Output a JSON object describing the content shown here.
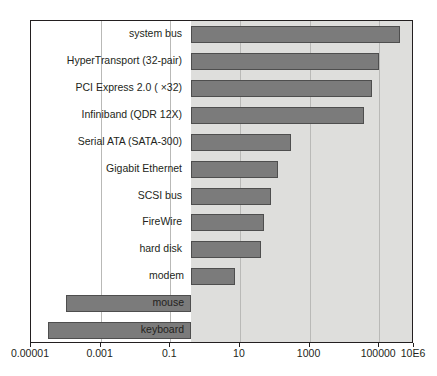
{
  "chart_data": {
    "type": "bar",
    "orientation": "horizontal",
    "title": "",
    "subtitle": "",
    "xlabel": "",
    "ylabel": "",
    "xscale": "log",
    "grid": true,
    "legend": null,
    "legend_position": "none",
    "xlim": [
      1e-05,
      1000000
    ],
    "xticks": [
      1e-05,
      0.001,
      0.1,
      10,
      1000,
      100000,
      1000000
    ],
    "xtick_labels": [
      "0.00001",
      "0.001",
      "0.1",
      "10",
      "1000",
      "100000",
      "10E6"
    ],
    "bar_color": "#7b7b7b",
    "bar_edge_color": "#4e4e4e",
    "plot_background": "#dededc",
    "categories": [
      "system bus",
      "HyperTransport (32-pair)",
      "PCI Express 2.0 ( ×32)",
      "Infiniband (QDR 12X)",
      "Serial ATA (SATA-300)",
      "Gigabit Ethernet",
      "SCSI bus",
      "FireWire",
      "hard disk",
      "modem",
      "mouse",
      "keyboard"
    ],
    "values": [
      400000,
      100000,
      64000,
      36000,
      300,
      125,
      80,
      50,
      40,
      7,
      0.0001,
      3e-05
    ],
    "value_unit": "megabytes per second",
    "bars": [
      {
        "label": "system bus",
        "value": 400000,
        "label_position": "outside-left"
      },
      {
        "label": "HyperTransport (32-pair)",
        "value": 100000,
        "label_position": "outside-left"
      },
      {
        "label": "PCI Express 2.0 ( ×32)",
        "value": 64000,
        "label_position": "outside-left"
      },
      {
        "label": "Infiniband (QDR 12X)",
        "value": 36000,
        "label_position": "outside-left"
      },
      {
        "label": "Serial ATA (SATA-300)",
        "value": 300,
        "label_position": "outside-left"
      },
      {
        "label": "Gigabit Ethernet",
        "value": 125,
        "label_position": "outside-left"
      },
      {
        "label": "SCSI bus",
        "value": 80,
        "label_position": "outside-left"
      },
      {
        "label": "FireWire",
        "value": 50,
        "label_position": "outside-left"
      },
      {
        "label": "hard disk",
        "value": 40,
        "label_position": "outside-left"
      },
      {
        "label": "modem",
        "value": 7,
        "label_position": "inside-bar"
      },
      {
        "label": "mouse",
        "value": 0.0001,
        "label_position": "inside-bar"
      },
      {
        "label": "keyboard",
        "value": 3e-05,
        "label_position": "inside-bar"
      }
    ]
  }
}
